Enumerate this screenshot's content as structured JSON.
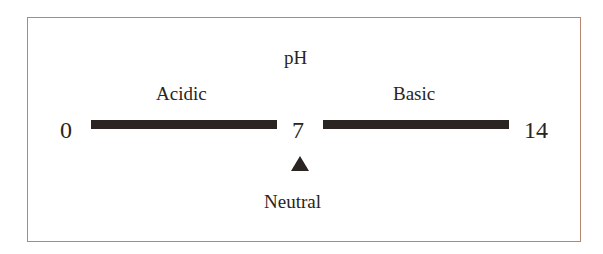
{
  "diagram": {
    "title": "pH",
    "regions": [
      {
        "label": "Acidic",
        "range": [
          0,
          7
        ]
      },
      {
        "label": "Basic",
        "range": [
          7,
          14
        ]
      }
    ],
    "scale": {
      "min": "0",
      "mid": "7",
      "max": "14"
    },
    "marker": {
      "label": "Neutral",
      "value": 7,
      "icon": "triangle-up-icon"
    },
    "colors": {
      "border": "#b8866e",
      "ink": "#2a2422"
    }
  }
}
